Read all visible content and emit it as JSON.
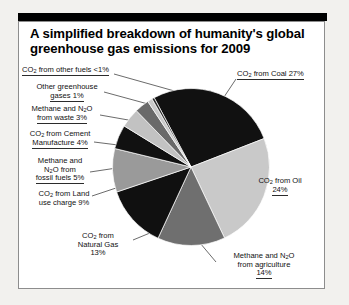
{
  "figure": {
    "title": "A simplified breakdown of humanity's global greenhouse gas emissions for 2009",
    "title_line1": "A simplified breakdown of humanity's global",
    "title_line2": "greenhouse gas emissions for 2009"
  },
  "chart_data": {
    "type": "pie",
    "title": "A simplified breakdown of humanity's global greenhouse gas emissions for 2009",
    "xlabel": "",
    "ylabel": "",
    "units": "percent of global greenhouse gas emissions",
    "year": "2009",
    "legend_position": "callout-labels",
    "grid": false,
    "categories": [
      "CO2 from Coal",
      "CO2 from Oil",
      "Methane and N2O from agriculture",
      "CO2 from Natural Gas",
      "CO2 from Land use charge",
      "Methane and N2O from fossil fuels",
      "CO2 from Cement Manufacture",
      "Methane and N2O from waste",
      "Other greenhouse gases",
      "CO2 from other fuels"
    ],
    "values": [
      27,
      24,
      14,
      13,
      9,
      5,
      4,
      3,
      1,
      0.5
    ],
    "value_labels": [
      "27%",
      "24%",
      "14%",
      "13%",
      "9%",
      "5%",
      "4%",
      "3%",
      "1%",
      "<1%"
    ],
    "colors": [
      "#111111",
      "#c9c9c9",
      "#6f6f6f",
      "#101010",
      "#9a9a9a",
      "#111111",
      "#c2c2c2",
      "#6a6a6a",
      "#c9c9c9",
      "#2a2a2a"
    ],
    "slices": [
      {
        "label": "CO2 from Coal",
        "display": "CO",
        "value": 27,
        "value_label": "27%",
        "color": "#111111"
      },
      {
        "label": "CO2 from Oil",
        "value": 24,
        "value_label": "24%",
        "color": "#c9c9c9"
      },
      {
        "label": "Methane and N2O from agriculture",
        "value": 14,
        "value_label": "14%",
        "color": "#6f6f6f"
      },
      {
        "label": "CO2 from Natural Gas",
        "value": 13,
        "value_label": "13%",
        "color": "#101010"
      },
      {
        "label": "CO2 from Land use charge",
        "value": 9,
        "value_label": "9%",
        "color": "#9a9a9a"
      },
      {
        "label": "Methane and N2O from fossil fuels",
        "value": 5,
        "value_label": "5%",
        "color": "#111111"
      },
      {
        "label": "CO2 from Cement Manufacture",
        "value": 4,
        "value_label": "4%",
        "color": "#c2c2c2"
      },
      {
        "label": "Methane and N2O from waste",
        "value": 3,
        "value_label": "3%",
        "color": "#6a6a6a"
      },
      {
        "label": "Other greenhouse gases",
        "value": 1,
        "value_label": "1%",
        "color": "#c9c9c9"
      },
      {
        "label": "CO2 from other fuels",
        "value": 0.5,
        "value_label": "<1%",
        "color": "#2a2a2a"
      }
    ]
  },
  "labels": {
    "other_fuels": {
      "pre": "CO",
      "sub": "2",
      "post": " from other fuels <1%"
    },
    "other_gases_l1": "Other greenhouse",
    "other_gases_l2": "gases 1%",
    "waste_l1_pre": "Methane and N",
    "waste_l1_sub": "2",
    "waste_l1_post": "O",
    "waste_l2": "from waste 3%",
    "cement_l1_pre": "CO",
    "cement_l1_sub": "2",
    "cement_l1_post": " from Cement",
    "cement_l2": "Manufacture 4%",
    "fossil_l1": "Methane and",
    "fossil_l2_pre": "N",
    "fossil_l2_sub": "2",
    "fossil_l2_post": "O from",
    "fossil_l3": "fossil fuels 5%",
    "land_l1_pre": "CO",
    "land_l1_sub": "2",
    "land_l1_post": " from Land",
    "land_l2": "use charge 9%",
    "natgas_l1_pre": "CO",
    "natgas_l1_sub": "2",
    "natgas_l1_post": " from",
    "natgas_l2": "Natural Gas",
    "natgas_l3": "13%",
    "coal_pre": "CO",
    "coal_sub": "2",
    "coal_post": " from Coal 27%",
    "oil_l1_pre": "CO",
    "oil_l1_sub": "2",
    "oil_l1_post": " from Oil",
    "oil_l2": "24%",
    "agri_l1_pre": "Methane and N",
    "agri_l1_sub": "2",
    "agri_l1_post": "O",
    "agri_l2": "from agriculture",
    "agri_l3": "14%"
  }
}
